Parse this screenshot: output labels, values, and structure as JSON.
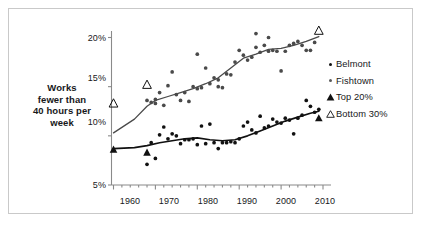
{
  "chart_data": {
    "type": "scatter",
    "title": "",
    "xlabel": "",
    "ylabel": "Works fewer than 40 hours per week",
    "xlim": [
      1957,
      2012
    ],
    "ylim": [
      5,
      21.5
    ],
    "xticks": [
      "1960",
      "1970",
      "1980",
      "1990",
      "2000",
      "2010"
    ],
    "xtick_values": [
      1960,
      1970,
      1980,
      1990,
      2000,
      2010
    ],
    "yticks": [
      "5%",
      "10%",
      "15%",
      "20%"
    ],
    "ytick_values": [
      5,
      10,
      15,
      20
    ],
    "grid": false,
    "legend_position": "right",
    "series": [
      {
        "name": "Fishtown",
        "marker": "filled-circle",
        "color": "#4a4a4a",
        "points": [
          [
            1968,
            13.6
          ],
          [
            1969,
            13.4
          ],
          [
            1970,
            13.3
          ],
          [
            1970,
            13.7
          ],
          [
            1971,
            14.4
          ],
          [
            1972,
            13.1
          ],
          [
            1973,
            15.1
          ],
          [
            1974,
            16.5
          ],
          [
            1975,
            14.2
          ],
          [
            1976,
            13.6
          ],
          [
            1977,
            14.4
          ],
          [
            1978,
            13.5
          ],
          [
            1979,
            15.0
          ],
          [
            1980,
            18.3
          ],
          [
            1980,
            14.8
          ],
          [
            1981,
            14.9
          ],
          [
            1982,
            16.9
          ],
          [
            1983,
            15.3
          ],
          [
            1984,
            15.9
          ],
          [
            1985,
            15.7
          ],
          [
            1985,
            15.0
          ],
          [
            1986,
            14.9
          ],
          [
            1987,
            16.3
          ],
          [
            1988,
            16.2
          ],
          [
            1989,
            17.5
          ],
          [
            1990,
            18.7
          ],
          [
            1991,
            18.2
          ],
          [
            1992,
            17.7
          ],
          [
            1993,
            18.0
          ],
          [
            1994,
            20.4
          ],
          [
            1994,
            19.0
          ],
          [
            1995,
            18.5
          ],
          [
            1996,
            19.2
          ],
          [
            1997,
            20.0
          ],
          [
            1997,
            18.6
          ],
          [
            1998,
            18.7
          ],
          [
            1999,
            18.6
          ],
          [
            2000,
            16.6
          ],
          [
            2001,
            18.6
          ],
          [
            2002,
            19.2
          ],
          [
            2003,
            19.4
          ],
          [
            2004,
            19.6
          ],
          [
            2005,
            19.2
          ],
          [
            2006,
            18.7
          ],
          [
            2007,
            18.7
          ],
          [
            2008,
            19.5
          ]
        ],
        "trend": [
          [
            1960,
            10.3
          ],
          [
            1965,
            11.7
          ],
          [
            1968,
            13.0
          ],
          [
            1970,
            13.6
          ],
          [
            1973,
            14.0
          ],
          [
            1976,
            14.4
          ],
          [
            1979,
            14.8
          ],
          [
            1982,
            15.3
          ],
          [
            1985,
            15.9
          ],
          [
            1988,
            16.9
          ],
          [
            1991,
            17.9
          ],
          [
            1994,
            18.3
          ],
          [
            1997,
            18.8
          ],
          [
            2000,
            18.9
          ],
          [
            2003,
            19.2
          ],
          [
            2006,
            19.6
          ],
          [
            2009,
            20.1
          ]
        ]
      },
      {
        "name": "Belmont",
        "marker": "filled-circle",
        "color": "#111111",
        "points": [
          [
            1968,
            7.1
          ],
          [
            1969,
            9.3
          ],
          [
            1970,
            7.7
          ],
          [
            1971,
            10.1
          ],
          [
            1972,
            10.9
          ],
          [
            1973,
            9.7
          ],
          [
            1974,
            10.2
          ],
          [
            1975,
            10.0
          ],
          [
            1976,
            9.2
          ],
          [
            1977,
            9.6
          ],
          [
            1978,
            9.6
          ],
          [
            1979,
            9.7
          ],
          [
            1980,
            9.1
          ],
          [
            1981,
            11.0
          ],
          [
            1982,
            9.2
          ],
          [
            1983,
            11.2
          ],
          [
            1984,
            9.3
          ],
          [
            1985,
            8.7
          ],
          [
            1986,
            9.3
          ],
          [
            1987,
            9.3
          ],
          [
            1988,
            9.4
          ],
          [
            1989,
            9.3
          ],
          [
            1990,
            9.7
          ],
          [
            1991,
            11.0
          ],
          [
            1992,
            11.4
          ],
          [
            1993,
            10.6
          ],
          [
            1994,
            10.3
          ],
          [
            1995,
            12.0
          ],
          [
            1996,
            10.8
          ],
          [
            1997,
            11.0
          ],
          [
            1998,
            11.7
          ],
          [
            1999,
            11.4
          ],
          [
            2000,
            11.3
          ],
          [
            2001,
            11.8
          ],
          [
            2002,
            11.6
          ],
          [
            2003,
            10.2
          ],
          [
            2004,
            11.8
          ],
          [
            2005,
            12.1
          ],
          [
            2006,
            13.6
          ],
          [
            2007,
            13.0
          ],
          [
            2008,
            12.4
          ],
          [
            2009,
            12.7
          ]
        ],
        "trend": [
          [
            1960,
            8.7
          ],
          [
            1965,
            8.8
          ],
          [
            1968,
            9.0
          ],
          [
            1971,
            9.3
          ],
          [
            1974,
            9.5
          ],
          [
            1977,
            9.7
          ],
          [
            1980,
            9.8
          ],
          [
            1983,
            9.6
          ],
          [
            1986,
            9.5
          ],
          [
            1989,
            9.6
          ],
          [
            1992,
            10.0
          ],
          [
            1995,
            10.5
          ],
          [
            1998,
            11.0
          ],
          [
            2001,
            11.5
          ],
          [
            2004,
            11.9
          ],
          [
            2007,
            12.3
          ],
          [
            2009,
            12.5
          ]
        ]
      },
      {
        "name": "Top 20%",
        "marker": "filled-triangle",
        "color": "#111111",
        "points": [
          [
            1960,
            8.6
          ],
          [
            1968,
            8.3
          ],
          [
            2009,
            11.8
          ]
        ]
      },
      {
        "name": "Bottom 30%",
        "marker": "open-triangle",
        "color": "#111111",
        "points": [
          [
            1960,
            13.3
          ],
          [
            1968,
            15.2
          ],
          [
            2009,
            20.7
          ]
        ]
      }
    ]
  },
  "legend": {
    "items": [
      {
        "label": "Belmont",
        "marker": "filled-circle",
        "color": "#111111"
      },
      {
        "label": "Fishtown",
        "marker": "filled-circle",
        "color": "#5a5a5a"
      },
      {
        "label": "Top 20%",
        "marker": "filled-triangle",
        "color": "#111111"
      },
      {
        "label": "Bottom 30%",
        "marker": "open-triangle",
        "color": "#111111"
      }
    ]
  },
  "axis_title": {
    "line1": "Works",
    "line2": "fewer than",
    "line3": "40 hours per",
    "line4": "week"
  },
  "colors": {
    "frame": "#c9c9c9",
    "axis": "#8a8a8a",
    "belmont": "#111111",
    "fishtown": "#5a5a5a",
    "text": "#17181a"
  }
}
